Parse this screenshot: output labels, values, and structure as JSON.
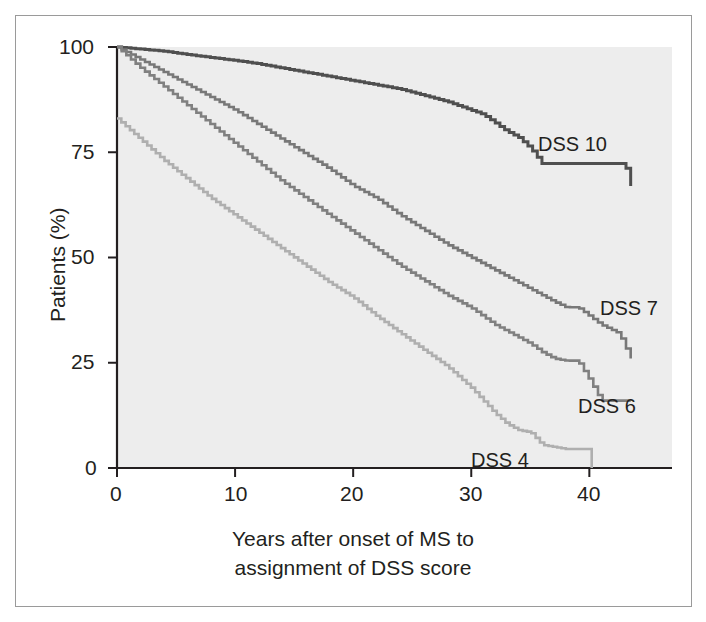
{
  "chart_data": {
    "type": "line",
    "title": "",
    "xlabel": "Years after onset of MS to assignment of DSS score",
    "ylabel": "Patients (%)",
    "xlim": [
      0,
      47
    ],
    "ylim": [
      0,
      100
    ],
    "xticks": [
      0,
      10,
      20,
      30,
      40
    ],
    "yticks": [
      0,
      25,
      50,
      75,
      100
    ],
    "xtick_labels": [
      "0",
      "10",
      "20",
      "30",
      "40"
    ],
    "ytick_labels": [
      "0",
      "25",
      "50",
      "75",
      "100"
    ],
    "grid": false,
    "legend_position": "inline-right-of-curves",
    "plot_background": "#ededed",
    "series": [
      {
        "name": "DSS 10",
        "label": "DSS 10",
        "color": "#4f4f4f",
        "x": [
          0,
          2,
          4,
          6,
          8,
          10,
          12,
          14,
          16,
          18,
          20,
          22,
          24,
          26,
          28,
          30,
          31,
          32,
          33,
          34,
          35,
          36,
          39,
          43,
          43.5
        ],
        "values": [
          100,
          99.5,
          99,
          98.2,
          97.5,
          96.8,
          96,
          95,
          94,
          93,
          92,
          91,
          90,
          88.5,
          87,
          85,
          84,
          82,
          80,
          78.5,
          76,
          72.3,
          72.3,
          72.3,
          67
        ]
      },
      {
        "name": "DSS 7",
        "label": "DSS 7",
        "color": "#787878",
        "x": [
          0,
          2,
          4,
          6,
          8,
          10,
          12,
          14,
          16,
          18,
          20,
          22,
          24,
          26,
          28,
          30,
          32,
          34,
          36,
          37,
          38,
          39,
          41,
          42.5,
          43,
          43.5
        ],
        "values": [
          100,
          97,
          94,
          91,
          88,
          85,
          81.5,
          78,
          74.5,
          71,
          67,
          64,
          60,
          56.5,
          53,
          50,
          47,
          44,
          41,
          39.5,
          38.2,
          38.2,
          34,
          32,
          29,
          26
        ]
      },
      {
        "name": "DSS 6",
        "label": "DSS 6",
        "color": "#808080",
        "x": [
          0,
          2,
          4,
          6,
          8,
          10,
          12,
          14,
          16,
          18,
          20,
          22,
          24,
          26,
          28,
          30,
          32,
          34,
          35,
          36,
          37,
          38,
          39,
          40,
          41,
          43.5
        ],
        "values": [
          100,
          95,
          90.5,
          86,
          81.5,
          77,
          72.5,
          68,
          64,
          60,
          56,
          52,
          48,
          44.5,
          41,
          38,
          34,
          31,
          29.5,
          27.5,
          26,
          25.5,
          25.5,
          21,
          16,
          16
        ]
      },
      {
        "name": "DSS 4",
        "label": "DSS 4",
        "color": "#afafaf",
        "x": [
          0,
          2,
          4,
          6,
          8,
          10,
          12,
          14,
          16,
          18,
          20,
          22,
          24,
          26,
          28,
          30,
          31,
          32,
          33,
          34,
          35,
          36,
          38,
          40,
          40.2
        ],
        "values": [
          83,
          78,
          73,
          68.5,
          64,
          60,
          56,
          52,
          48,
          44,
          40.5,
          36,
          32,
          28,
          24,
          19,
          16,
          13,
          10.5,
          9,
          8.5,
          5.5,
          4.5,
          4.5,
          0
        ]
      }
    ],
    "series_label_positions": [
      {
        "name": "DSS 10",
        "x_px": 538,
        "y_px": 133
      },
      {
        "name": "DSS 7",
        "x_px": 600,
        "y_px": 297
      },
      {
        "name": "DSS 6",
        "x_px": 578,
        "y_px": 395
      },
      {
        "name": "DSS 4",
        "x_px": 471,
        "y_px": 449
      }
    ]
  },
  "axes": {
    "y_title": "Patients (%)",
    "x_title_line1": "Years after onset of MS to",
    "x_title_line2": "assignment of DSS score",
    "y_ticks": [
      "100",
      "75",
      "50",
      "25",
      "0"
    ],
    "x_ticks": [
      "0",
      "10",
      "20",
      "30",
      "40"
    ]
  }
}
